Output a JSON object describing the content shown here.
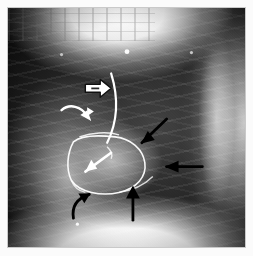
{
  "figure": {
    "modality": "X-ray",
    "projection": "lateral",
    "background_color": "#000000",
    "frame_color": "#c9c9c9",
    "page_color": "#fbfbfb",
    "visible_text": []
  },
  "annotations": {
    "white_color": "#ffffff",
    "black_color": "#000000",
    "markers": [
      {
        "id": "open-arrow-right",
        "icon": "open-arrow-right-icon",
        "color": "#ffffff",
        "style": "open outlined arrow",
        "direction": "right",
        "x": 100,
        "y": 85
      },
      {
        "id": "curved-arrow-white-upper",
        "icon": "curved-arrow-white-icon",
        "color": "#ffffff",
        "style": "curved solid arrow",
        "direction": "down-right",
        "x": 78,
        "y": 112
      },
      {
        "id": "straight-arrow-white-mid",
        "icon": "straight-arrow-white-icon",
        "color": "#ffffff",
        "style": "straight solid arrow",
        "direction": "up-right",
        "x": 105,
        "y": 165
      },
      {
        "id": "diagonal-arrow-black-upper",
        "icon": "diagonal-arrow-black-icon",
        "color": "#000000",
        "style": "straight solid arrow",
        "direction": "down-left",
        "x": 150,
        "y": 140
      },
      {
        "id": "horizontal-arrow-black-right",
        "icon": "horizontal-arrow-black-icon",
        "color": "#000000",
        "style": "straight solid arrow",
        "direction": "left",
        "x": 175,
        "y": 170
      },
      {
        "id": "curved-arrow-black-lower",
        "icon": "curved-arrow-black-icon",
        "color": "#000000",
        "style": "curved solid arrow",
        "direction": "up-right",
        "x": 82,
        "y": 205
      },
      {
        "id": "vertical-arrow-black-lower",
        "icon": "vertical-arrow-black-icon",
        "color": "#000000",
        "style": "straight solid arrow",
        "direction": "up",
        "x": 131,
        "y": 205
      }
    ],
    "traced_outlines": [
      {
        "id": "vertical-white-line",
        "color": "#ffffff",
        "description": "long curved white line running superior-to-inferior through mid field"
      },
      {
        "id": "mass-outline-white",
        "color": "#ffffff",
        "description": "closed white outline around retrocardiac soft-tissue mass"
      },
      {
        "id": "inner-outline-white",
        "color": "#ffffff",
        "description": "inner white outline within the mass"
      }
    ],
    "bright_dots": [
      {
        "id": "marker-dot-upper",
        "color": "#ffffff",
        "x": 127,
        "y": 50
      },
      {
        "id": "marker-dot-left",
        "color": "#ffffff",
        "x": 60,
        "y": 53
      },
      {
        "id": "marker-dot-right",
        "color": "#ffffff",
        "x": 193,
        "y": 51
      },
      {
        "id": "marker-dot-bottom",
        "color": "#ffffff",
        "x": 76,
        "y": 224
      }
    ]
  }
}
